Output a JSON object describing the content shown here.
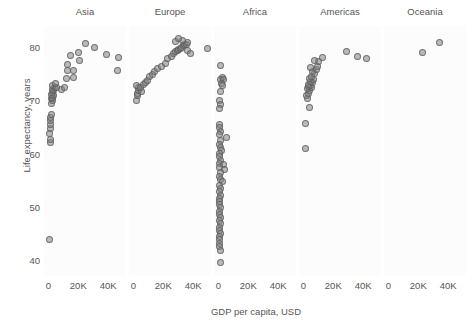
{
  "chart_data": {
    "type": "scatter",
    "title": "",
    "xlabel": "GDP per capita, USD",
    "ylabel": "Life expectancy, years",
    "xlim": [
      -3000,
      52000
    ],
    "ylim": [
      37,
      84
    ],
    "grid": false,
    "legend": "none",
    "facet_by": "continent",
    "xticks": [
      0,
      20000,
      40000
    ],
    "xticklabels": [
      "0",
      "20K",
      "40K"
    ],
    "yticks": [
      40,
      50,
      60,
      70,
      80
    ],
    "yticklabels": [
      "40",
      "50",
      "60",
      "70",
      "80"
    ],
    "marker": {
      "shape": "circle",
      "fill": "#828282",
      "opacity": 0.55,
      "edge": "#5a5a5a",
      "size_px": 7
    },
    "panels": [
      {
        "label": "Asia",
        "points": [
          {
            "x": 900,
            "y": 43.8
          },
          {
            "x": 1100,
            "y": 62.1
          },
          {
            "x": 1250,
            "y": 62.7
          },
          {
            "x": 1000,
            "y": 63.8
          },
          {
            "x": 1400,
            "y": 64.7
          },
          {
            "x": 1200,
            "y": 65.5
          },
          {
            "x": 1500,
            "y": 66.3
          },
          {
            "x": 1350,
            "y": 66.8
          },
          {
            "x": 1700,
            "y": 67.3
          },
          {
            "x": 2200,
            "y": 69.5
          },
          {
            "x": 2600,
            "y": 70.0
          },
          {
            "x": 1900,
            "y": 70.3
          },
          {
            "x": 2400,
            "y": 70.6
          },
          {
            "x": 3100,
            "y": 70.9
          },
          {
            "x": 2000,
            "y": 71.2
          },
          {
            "x": 2800,
            "y": 71.5
          },
          {
            "x": 3600,
            "y": 71.8
          },
          {
            "x": 2500,
            "y": 72.1
          },
          {
            "x": 4200,
            "y": 72.4
          },
          {
            "x": 3000,
            "y": 72.8
          },
          {
            "x": 5100,
            "y": 72.5
          },
          {
            "x": 4700,
            "y": 73.2
          },
          {
            "x": 8500,
            "y": 72.0
          },
          {
            "x": 12000,
            "y": 74.2
          },
          {
            "x": 17000,
            "y": 74.4
          },
          {
            "x": 13000,
            "y": 75.6
          },
          {
            "x": 16500,
            "y": 75.7
          },
          {
            "x": 12500,
            "y": 76.8
          },
          {
            "x": 21000,
            "y": 77.6
          },
          {
            "x": 14500,
            "y": 78.4
          },
          {
            "x": 20000,
            "y": 79.0
          },
          {
            "x": 25000,
            "y": 80.7
          },
          {
            "x": 31000,
            "y": 80.0
          },
          {
            "x": 39000,
            "y": 78.6
          },
          {
            "x": 47000,
            "y": 78.0
          },
          {
            "x": 46000,
            "y": 75.6
          },
          {
            "x": 11000,
            "y": 72.4
          }
        ]
      },
      {
        "label": "Europe",
        "points": [
          {
            "x": 1800,
            "y": 70.0
          },
          {
            "x": 2400,
            "y": 71.0
          },
          {
            "x": 2900,
            "y": 71.4
          },
          {
            "x": 3400,
            "y": 71.8
          },
          {
            "x": 3100,
            "y": 72.4
          },
          {
            "x": 2100,
            "y": 72.8
          },
          {
            "x": 5300,
            "y": 71.7
          },
          {
            "x": 4800,
            "y": 72.5
          },
          {
            "x": 6500,
            "y": 73.0
          },
          {
            "x": 7800,
            "y": 73.3
          },
          {
            "x": 9200,
            "y": 73.8
          },
          {
            "x": 10500,
            "y": 74.5
          },
          {
            "x": 12500,
            "y": 74.8
          },
          {
            "x": 14200,
            "y": 75.4
          },
          {
            "x": 16000,
            "y": 76.0
          },
          {
            "x": 19000,
            "y": 76.4
          },
          {
            "x": 21500,
            "y": 77.0
          },
          {
            "x": 23000,
            "y": 77.9
          },
          {
            "x": 25500,
            "y": 78.3
          },
          {
            "x": 27000,
            "y": 78.8
          },
          {
            "x": 28500,
            "y": 79.2
          },
          {
            "x": 29500,
            "y": 79.4
          },
          {
            "x": 30500,
            "y": 79.6
          },
          {
            "x": 31500,
            "y": 79.8
          },
          {
            "x": 32500,
            "y": 80.0
          },
          {
            "x": 33500,
            "y": 80.3
          },
          {
            "x": 34500,
            "y": 80.5
          },
          {
            "x": 35500,
            "y": 80.6
          },
          {
            "x": 36500,
            "y": 80.9
          },
          {
            "x": 28000,
            "y": 81.0
          },
          {
            "x": 33000,
            "y": 81.3
          },
          {
            "x": 30000,
            "y": 81.7
          },
          {
            "x": 36000,
            "y": 79.4
          },
          {
            "x": 38000,
            "y": 78.9
          },
          {
            "x": 49500,
            "y": 79.8
          }
        ]
      },
      {
        "label": "Africa",
        "points": [
          {
            "x": 1200,
            "y": 76.5
          },
          {
            "x": 2600,
            "y": 74.4
          },
          {
            "x": 1500,
            "y": 74.0
          },
          {
            "x": 3600,
            "y": 73.9
          },
          {
            "x": 1900,
            "y": 73.2
          },
          {
            "x": 2400,
            "y": 72.8
          },
          {
            "x": 1300,
            "y": 71.6
          },
          {
            "x": 900,
            "y": 70.0
          },
          {
            "x": 1100,
            "y": 69.3
          },
          {
            "x": 800,
            "y": 68.4
          },
          {
            "x": 700,
            "y": 65.5
          },
          {
            "x": 1000,
            "y": 64.9
          },
          {
            "x": 1400,
            "y": 64.2
          },
          {
            "x": 900,
            "y": 63.6
          },
          {
            "x": 5400,
            "y": 63.0
          },
          {
            "x": 1100,
            "y": 62.4
          },
          {
            "x": 700,
            "y": 61.8
          },
          {
            "x": 1300,
            "y": 61.2
          },
          {
            "x": 2100,
            "y": 60.6
          },
          {
            "x": 800,
            "y": 60.0
          },
          {
            "x": 1000,
            "y": 59.4
          },
          {
            "x": 1600,
            "y": 58.8
          },
          {
            "x": 600,
            "y": 58.2
          },
          {
            "x": 3400,
            "y": 58.0
          },
          {
            "x": 900,
            "y": 57.4
          },
          {
            "x": 4200,
            "y": 57.0
          },
          {
            "x": 1200,
            "y": 56.4
          },
          {
            "x": 700,
            "y": 55.8
          },
          {
            "x": 1500,
            "y": 55.2
          },
          {
            "x": 3000,
            "y": 54.8
          },
          {
            "x": 800,
            "y": 54.0
          },
          {
            "x": 1100,
            "y": 53.4
          },
          {
            "x": 600,
            "y": 52.8
          },
          {
            "x": 1300,
            "y": 52.2
          },
          {
            "x": 900,
            "y": 51.6
          },
          {
            "x": 700,
            "y": 51.0
          },
          {
            "x": 1000,
            "y": 50.4
          },
          {
            "x": 1400,
            "y": 49.8
          },
          {
            "x": 600,
            "y": 49.2
          },
          {
            "x": 800,
            "y": 48.6
          },
          {
            "x": 1100,
            "y": 48.0
          },
          {
            "x": 700,
            "y": 47.4
          },
          {
            "x": 1600,
            "y": 46.8
          },
          {
            "x": 900,
            "y": 46.2
          },
          {
            "x": 600,
            "y": 45.6
          },
          {
            "x": 1200,
            "y": 45.0
          },
          {
            "x": 800,
            "y": 44.4
          },
          {
            "x": 700,
            "y": 43.8
          },
          {
            "x": 1000,
            "y": 43.2
          },
          {
            "x": 900,
            "y": 42.6
          },
          {
            "x": 1400,
            "y": 41.8
          },
          {
            "x": 1300,
            "y": 39.6
          }
        ]
      },
      {
        "label": "Americas",
        "points": [
          {
            "x": 1200,
            "y": 60.9
          },
          {
            "x": 1500,
            "y": 65.6
          },
          {
            "x": 3800,
            "y": 68.6
          },
          {
            "x": 2900,
            "y": 70.3
          },
          {
            "x": 2200,
            "y": 71.0
          },
          {
            "x": 3300,
            "y": 71.4
          },
          {
            "x": 4100,
            "y": 71.8
          },
          {
            "x": 2600,
            "y": 72.2
          },
          {
            "x": 5200,
            "y": 72.4
          },
          {
            "x": 3600,
            "y": 72.6
          },
          {
            "x": 4600,
            "y": 72.8
          },
          {
            "x": 3100,
            "y": 73.0
          },
          {
            "x": 5800,
            "y": 73.3
          },
          {
            "x": 4400,
            "y": 73.6
          },
          {
            "x": 6900,
            "y": 73.9
          },
          {
            "x": 3900,
            "y": 74.2
          },
          {
            "x": 5500,
            "y": 74.6
          },
          {
            "x": 7600,
            "y": 75.0
          },
          {
            "x": 6200,
            "y": 75.4
          },
          {
            "x": 8600,
            "y": 75.8
          },
          {
            "x": 4800,
            "y": 76.2
          },
          {
            "x": 9500,
            "y": 76.4
          },
          {
            "x": 10200,
            "y": 77.3
          },
          {
            "x": 7200,
            "y": 77.6
          },
          {
            "x": 12500,
            "y": 78.0
          },
          {
            "x": 29000,
            "y": 79.3
          },
          {
            "x": 36000,
            "y": 78.2
          },
          {
            "x": 42000,
            "y": 77.8
          }
        ]
      },
      {
        "label": "Oceania",
        "points": [
          {
            "x": 23000,
            "y": 79.1
          },
          {
            "x": 34500,
            "y": 80.9
          }
        ]
      }
    ]
  }
}
